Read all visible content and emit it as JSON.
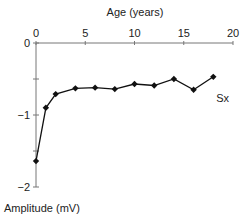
{
  "chart_data": {
    "type": "line",
    "title": "",
    "xlabel": "Age (years)",
    "ylabel": "Amplitude (mV)",
    "xlim": [
      0,
      20
    ],
    "ylim": [
      -2,
      0
    ],
    "x_ticks": [
      0,
      5,
      10,
      15,
      20
    ],
    "x_tick_labels": [
      "0",
      "5",
      "10",
      "15",
      "20"
    ],
    "y_ticks": [
      0,
      -0.5,
      -1,
      -1.5,
      -2
    ],
    "y_tick_labels": [
      "0",
      "",
      "−1",
      "",
      "−2"
    ],
    "x_axis_position": "top",
    "grid": false,
    "legend": "none",
    "annotations": [
      {
        "text": "Sx",
        "x": 18.3,
        "y": -0.82
      }
    ],
    "series": [
      {
        "name": "Sx",
        "marker": "diamond",
        "color": "#111111",
        "x": [
          0,
          1,
          2,
          4,
          6,
          8,
          10,
          12,
          14,
          16,
          18
        ],
        "values": [
          -1.64,
          -0.9,
          -0.71,
          -0.63,
          -0.62,
          -0.64,
          -0.57,
          -0.59,
          -0.5,
          -0.65,
          -0.47
        ]
      }
    ]
  }
}
